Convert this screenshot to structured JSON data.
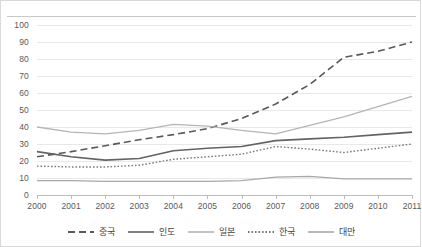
{
  "chart_data": {
    "type": "line",
    "title": "",
    "xlabel": "",
    "ylabel": "",
    "x": [
      2000,
      2001,
      2002,
      2003,
      2004,
      2005,
      2006,
      2007,
      2008,
      2009,
      2010,
      2011
    ],
    "xtick_labels": [
      "2000",
      "2001",
      "2002",
      "2003",
      "2004",
      "2005",
      "2006",
      "2007",
      "2008",
      "2009",
      "2010",
      "2011"
    ],
    "ytick_labels": [
      "0",
      "10",
      "20",
      "30",
      "40",
      "50",
      "60",
      "70",
      "80",
      "90",
      "100"
    ],
    "yticks": [
      0,
      10,
      20,
      30,
      40,
      50,
      60,
      70,
      80,
      90,
      100
    ],
    "ylim": [
      0,
      100
    ],
    "xlim": [
      2000,
      2011
    ],
    "grid": "horizontal",
    "legend_position": "bottom",
    "series": [
      {
        "name": "중국",
        "style": "dashed",
        "color": "#595959",
        "width": 1.6,
        "values": [
          22.5,
          25.5,
          29.0,
          32.5,
          35.5,
          39.0,
          45.0,
          53.5,
          65.0,
          81.0,
          84.5,
          90.0
        ]
      },
      {
        "name": "인도",
        "style": "solid",
        "color": "#636363",
        "width": 1.6,
        "values": [
          25.5,
          22.5,
          20.5,
          21.5,
          26.0,
          27.5,
          28.5,
          32.0,
          33.0,
          34.0,
          35.5,
          37.0
        ]
      },
      {
        "name": "일본",
        "style": "solid",
        "color": "#b5b5b5",
        "width": 1.3,
        "values": [
          40.0,
          37.0,
          36.0,
          38.0,
          41.5,
          40.5,
          38.0,
          36.0,
          41.0,
          46.0,
          52.0,
          58.0
        ]
      },
      {
        "name": "한국",
        "style": "dotted",
        "color": "#7a7a7a",
        "width": 1.4,
        "values": [
          17.0,
          16.5,
          16.5,
          17.5,
          21.0,
          22.5,
          24.0,
          28.5,
          27.0,
          25.0,
          27.5,
          30.0
        ]
      },
      {
        "name": "대만",
        "style": "solid",
        "color": "#a8a8a8",
        "width": 1.3,
        "values": [
          8.5,
          8.5,
          8.0,
          8.0,
          8.0,
          8.0,
          8.5,
          10.5,
          11.0,
          9.5,
          9.5,
          9.5
        ]
      }
    ]
  },
  "legend": {
    "items": [
      {
        "label": "중국",
        "style": "dashed",
        "color": "#595959"
      },
      {
        "label": "인도",
        "style": "solid",
        "color": "#636363"
      },
      {
        "label": "일본",
        "style": "solid",
        "color": "#b5b5b5"
      },
      {
        "label": "한국",
        "style": "dotted",
        "color": "#7a7a7a"
      },
      {
        "label": "대만",
        "style": "solid",
        "color": "#a8a8a8"
      }
    ]
  }
}
